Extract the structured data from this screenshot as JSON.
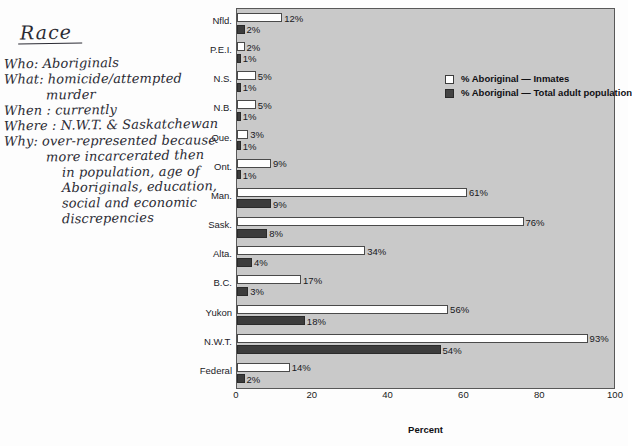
{
  "annotation": {
    "title": "Race",
    "lines": [
      {
        "text": "Who: Aboriginals",
        "indent": 0,
        "spacer": false
      },
      {
        "text": "What: homicide/attempted",
        "indent": 0,
        "spacer": false
      },
      {
        "text": "murder",
        "indent": 1,
        "spacer": false
      },
      {
        "text": "When : currently",
        "indent": 0,
        "spacer": false
      },
      {
        "text": "Where : N.W.T. & Saskatchewan",
        "indent": 0,
        "spacer": false
      },
      {
        "text": "Why: over-represented because",
        "indent": 0,
        "spacer": false
      },
      {
        "text": "more incarcerated then",
        "indent": 1,
        "spacer": false
      },
      {
        "text": "in population, age of",
        "indent": 2,
        "spacer": false
      },
      {
        "text": "Aboriginals, education,",
        "indent": 2,
        "spacer": false
      },
      {
        "text": "social and economic",
        "indent": 2,
        "spacer": false
      },
      {
        "text": "discrepencies",
        "indent": 2,
        "spacer": false
      }
    ]
  },
  "chart_data": {
    "type": "bar",
    "orientation": "horizontal",
    "title": "",
    "xlabel": "Percent",
    "ylabel": "",
    "xlim": [
      0,
      100
    ],
    "xticks": [
      0,
      20,
      40,
      60,
      80,
      100
    ],
    "xtick_labels": [
      "0",
      "20",
      "40",
      "60",
      "80",
      "100"
    ],
    "grid": false,
    "legend_position": "upper-right-inside",
    "categories": [
      "Nfld.",
      "P.E.I.",
      "N.S.",
      "N.B.",
      "Que.",
      "Ont.",
      "Man.",
      "Sask.",
      "Alta.",
      "B.C.",
      "Yukon",
      "N.W.T.",
      "Federal"
    ],
    "series": [
      {
        "name": "% Aboriginal — Inmates",
        "color": "#ffffff",
        "values": [
          12,
          2,
          5,
          5,
          3,
          9,
          61,
          76,
          34,
          17,
          56,
          93,
          14
        ],
        "labels": [
          "12%",
          "2%",
          "5%",
          "5%",
          "3%",
          "9%",
          "61%",
          "76%",
          "34%",
          "17%",
          "56%",
          "93%",
          "14%"
        ]
      },
      {
        "name": "% Aboriginal — Total adult population",
        "color": "#3c3c3c",
        "values": [
          2,
          1,
          1,
          1,
          1,
          1,
          9,
          8,
          4,
          3,
          18,
          54,
          2
        ],
        "labels": [
          "2%",
          "1%",
          "1%",
          "1%",
          "1%",
          "1%",
          "9%",
          "8%",
          "4%",
          "3%",
          "18%",
          "54%",
          "2%"
        ]
      }
    ]
  },
  "colors": {
    "plot_background": "#c9c9c9",
    "page_background": "#fdfdfd",
    "inmates_bar": "#ffffff",
    "adult_bar": "#3c3c3c",
    "frame": "#585858",
    "ink": "#2b2b34"
  }
}
